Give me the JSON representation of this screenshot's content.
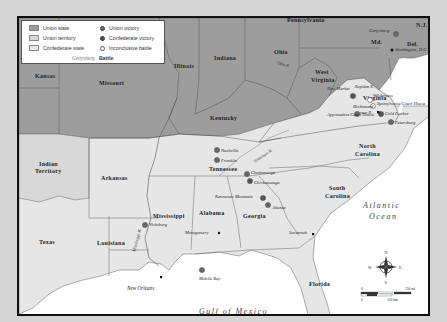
{
  "legend": {
    "items": [
      {
        "label": "Union state",
        "swatch": "#9d9d9d"
      },
      {
        "label": "Union territory",
        "swatch": "#d8d8d8"
      },
      {
        "label": "Confederate state",
        "swatch": "#e6e6e6"
      },
      {
        "label": "Union victory",
        "marker": "#6a6a6a"
      },
      {
        "label": "Confederate victory",
        "marker": "#555555"
      },
      {
        "label": "Inconclusive battle",
        "marker": "#ffffff"
      }
    ],
    "example_city": "Gettysburg",
    "example_label": "Battle"
  },
  "colors": {
    "union_state": "#9d9d9d",
    "union_territory": "#d8d8d8",
    "confederate_state": "#e6e6e6",
    "water": "#ffffff",
    "border": "#555555"
  },
  "states": {
    "pennsylvania": "Pennsylvania",
    "nj": "N.J.",
    "md": "Md.",
    "del": "Del.",
    "ohio": "Ohio",
    "indiana": "Indiana",
    "illinois": "Illinois",
    "kansas": "Kansas",
    "missouri": "Missouri",
    "kentucky": "Kentucky",
    "west_virginia_1": "West",
    "west_virginia_2": "Virginia",
    "virginia": "Virginia",
    "indian_territory_1": "Indian",
    "indian_territory_2": "Territory",
    "arkansas": "Arkansas",
    "tennessee": "Tennessee",
    "north_carolina_1": "North",
    "north_carolina_2": "Carolina",
    "south_carolina_1": "South",
    "south_carolina_2": "Carolina",
    "mississippi": "Mississippi",
    "alabama": "Alabama",
    "georgia": "Georgia",
    "texas": "Texas",
    "louisiana": "Louisiana",
    "florida": "Florida"
  },
  "water": {
    "atlantic_1": "Atlantic",
    "atlantic_2": "Ocean",
    "gulf": "Gulf of Mexico",
    "ohio_river": "Ohio R.",
    "tennessee_river": "Tennessee R.",
    "mississippi_river": "Mississippi R.",
    "rapidan_river": "Rapidan R.",
    "james_river": "James R."
  },
  "battles": [
    {
      "name": "Gettysburg",
      "result": "union"
    },
    {
      "name": "New Market",
      "result": "confederate"
    },
    {
      "name": "Wilderness",
      "result": "inconclusive"
    },
    {
      "name": "Spotsylvania Court House",
      "result": "inconclusive"
    },
    {
      "name": "Cold Harbor",
      "result": "confederate"
    },
    {
      "name": "Petersburg",
      "result": "union"
    },
    {
      "name": "Appomattox Court House",
      "result": "union"
    },
    {
      "name": "Nashville",
      "result": "union"
    },
    {
      "name": "Franklin",
      "result": "union"
    },
    {
      "name": "Chattanooga",
      "result": "union"
    },
    {
      "name": "Chickamauga",
      "result": "confederate"
    },
    {
      "name": "Kennesaw Mountain",
      "result": "confederate"
    },
    {
      "name": "Atlanta",
      "result": "union"
    },
    {
      "name": "Vicksburg",
      "result": "union"
    },
    {
      "name": "Mobile Bay",
      "result": "union"
    }
  ],
  "cities": {
    "washington": "Washington, D.C.",
    "richmond": "Richmond",
    "montgomery": "Montgomery",
    "savannah": "Savannah",
    "new_orleans": "New Orleans"
  },
  "compass": {
    "n": "N",
    "s": "S",
    "e": "E",
    "w": "W"
  },
  "scale": {
    "zero_mi": "0",
    "max_mi": "150 mi.",
    "zero_km": "0",
    "max_km": "150 km"
  }
}
